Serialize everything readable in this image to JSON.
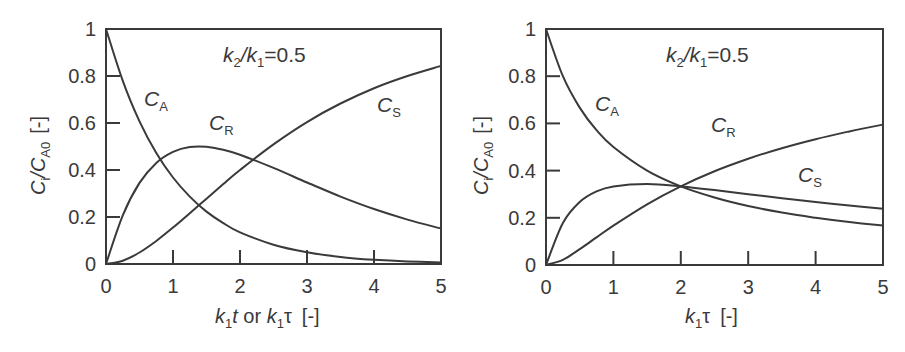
{
  "chart_data": [
    {
      "type": "line",
      "panel": "left",
      "title": "",
      "annotation": "k2/k1=0.5",
      "xlabel": "k1t or k1τ  [-]",
      "ylabel": "Ci/CA0  [-]",
      "xlim": [
        0,
        5
      ],
      "ylim": [
        0,
        1
      ],
      "xticks": [
        "0",
        "1",
        "2",
        "3",
        "4",
        "5"
      ],
      "yticks": [
        "0",
        "0.2",
        "0.4",
        "0.6",
        "0.8",
        "1"
      ],
      "grid": false,
      "legend": "inline curve labels",
      "x": [
        0,
        0.25,
        0.5,
        0.75,
        1,
        1.25,
        1.5,
        1.75,
        2,
        2.5,
        3,
        3.5,
        4,
        4.5,
        5
      ],
      "series": [
        {
          "name": "CA",
          "values": [
            1,
            0.779,
            0.607,
            0.472,
            0.368,
            0.287,
            0.223,
            0.174,
            0.135,
            0.082,
            0.05,
            0.03,
            0.018,
            0.011,
            0.007
          ]
        },
        {
          "name": "CR",
          "values": [
            0,
            0.207,
            0.345,
            0.43,
            0.477,
            0.498,
            0.499,
            0.486,
            0.465,
            0.409,
            0.347,
            0.287,
            0.234,
            0.189,
            0.151
          ]
        },
        {
          "name": "CS",
          "values": [
            0,
            0.014,
            0.049,
            0.098,
            0.155,
            0.216,
            0.278,
            0.34,
            0.4,
            0.509,
            0.604,
            0.683,
            0.748,
            0.8,
            0.843
          ]
        }
      ]
    },
    {
      "type": "line",
      "panel": "right",
      "title": "",
      "annotation": "k2/k1=0.5",
      "xlabel": "k1τ  [-]",
      "ylabel": "Ci/CA0  [-]",
      "xlim": [
        0,
        5
      ],
      "ylim": [
        0,
        1
      ],
      "xticks": [
        "0",
        "1",
        "2",
        "3",
        "4",
        "5"
      ],
      "yticks": [
        "0",
        "0.2",
        "0.4",
        "0.6",
        "0.8",
        "1"
      ],
      "grid": false,
      "legend": "inline curve labels",
      "x": [
        0,
        0.25,
        0.5,
        0.75,
        1,
        1.5,
        2,
        2.5,
        3,
        3.5,
        4,
        4.5,
        5
      ],
      "series": [
        {
          "name": "CA",
          "values": [
            1,
            0.8,
            0.667,
            0.571,
            0.5,
            0.4,
            0.333,
            0.286,
            0.25,
            0.222,
            0.2,
            0.182,
            0.167
          ]
        },
        {
          "name": "CR",
          "values": [
            0,
            0.178,
            0.267,
            0.312,
            0.333,
            0.343,
            0.333,
            0.318,
            0.3,
            0.283,
            0.267,
            0.252,
            0.238
          ]
        },
        {
          "name": "CS",
          "values": [
            0,
            0.022,
            0.067,
            0.117,
            0.167,
            0.257,
            0.333,
            0.397,
            0.45,
            0.495,
            0.533,
            0.566,
            0.595
          ]
        }
      ]
    }
  ],
  "labels": {
    "left": {
      "annot_k2": "k",
      "annot_k2_sub": "2",
      "annot_mid": "/k",
      "annot_k1_sub": "1",
      "annot_val": "=0.5",
      "ylabel_c": "C",
      "ylabel_i": "i",
      "ylabel_slash": "/C",
      "ylabel_a0": "A0",
      "ylabel_unit": "[-]",
      "xlabel_k": "k",
      "xlabel_1": "1",
      "xlabel_t": "t",
      "xlabel_or": " or ",
      "xlabel_k2": "k",
      "xlabel_12": "1",
      "xlabel_tau": "τ",
      "xlabel_unit": "[-]",
      "ca": "C",
      "ca_sub": "A",
      "cr": "C",
      "cr_sub": "R",
      "cs": "C",
      "cs_sub": "S"
    },
    "right": {
      "annot_k2": "k",
      "annot_k2_sub": "2",
      "annot_mid": "/k",
      "annot_k1_sub": "1",
      "annot_val": "=0.5",
      "ylabel_c": "C",
      "ylabel_i": "i",
      "ylabel_slash": "/C",
      "ylabel_a0": "A0",
      "ylabel_unit": "[-]",
      "xlabel_k": "k",
      "xlabel_1": "1",
      "xlabel_tau": "τ",
      "xlabel_unit": "[-]",
      "ca": "C",
      "ca_sub": "A",
      "cr": "C",
      "cr_sub": "R",
      "cs": "C",
      "cs_sub": "S"
    }
  },
  "colors": {
    "line": "#3a3a3a",
    "background": "#ffffff"
  }
}
